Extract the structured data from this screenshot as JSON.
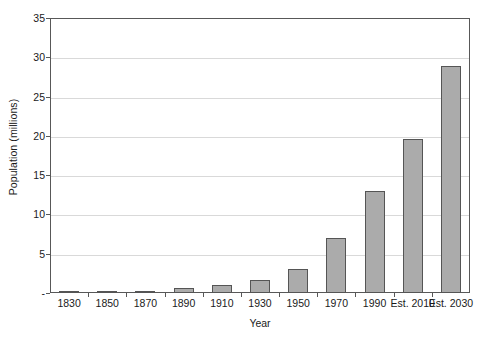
{
  "chart_data": {
    "type": "bar",
    "title": "",
    "xlabel": "Year",
    "ylabel": "Population (millions)",
    "categories": [
      "1830",
      "1850",
      "1870",
      "1890",
      "1910",
      "1930",
      "1950",
      "1970",
      "1990",
      "Est. 2010",
      "Est. 2030"
    ],
    "values": [
      0.1,
      0.15,
      0.3,
      0.6,
      1.0,
      1.7,
      3.0,
      7.0,
      13.0,
      19.6,
      28.9
    ],
    "ylim": [
      0,
      35
    ],
    "yticks": [
      "-",
      "5",
      "10",
      "15",
      "20",
      "25",
      "30",
      "35"
    ],
    "ytick_values": [
      0,
      5,
      10,
      15,
      20,
      25,
      30,
      35
    ],
    "grid": "horizontal",
    "legend": "none",
    "bar_color": "#ababab",
    "bar_border_color": "#555555",
    "gridline_color": "#d9d9d9",
    "axis_color": "#585858"
  }
}
